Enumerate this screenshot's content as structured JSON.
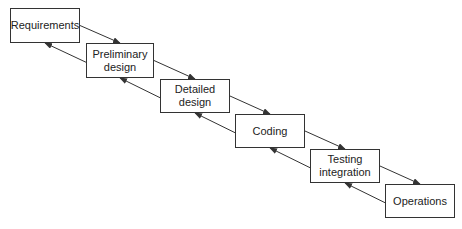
{
  "diagram": {
    "type": "waterfall",
    "stages": [
      {
        "id": "requirements",
        "label": "Requirements",
        "x": 10,
        "y": 8,
        "w": 70,
        "h": 35
      },
      {
        "id": "preliminary-design",
        "label": "Preliminary\ndesign",
        "x": 86,
        "y": 43,
        "w": 68,
        "h": 35
      },
      {
        "id": "detailed-design",
        "label": "Detailed\ndesign",
        "x": 160,
        "y": 79,
        "w": 70,
        "h": 34
      },
      {
        "id": "coding",
        "label": "Coding",
        "x": 235,
        "y": 114,
        "w": 70,
        "h": 34
      },
      {
        "id": "testing-integration",
        "label": "Testing\nintegration",
        "x": 310,
        "y": 149,
        "w": 70,
        "h": 34
      },
      {
        "id": "operations",
        "label": "Operations",
        "x": 385,
        "y": 184,
        "w": 70,
        "h": 34
      }
    ],
    "arrows": [
      {
        "from": "requirements",
        "to": "preliminary-design",
        "direction": "forward"
      },
      {
        "from": "preliminary-design",
        "to": "requirements",
        "direction": "feedback"
      },
      {
        "from": "preliminary-design",
        "to": "detailed-design",
        "direction": "forward"
      },
      {
        "from": "detailed-design",
        "to": "preliminary-design",
        "direction": "feedback"
      },
      {
        "from": "detailed-design",
        "to": "coding",
        "direction": "forward"
      },
      {
        "from": "coding",
        "to": "detailed-design",
        "direction": "feedback"
      },
      {
        "from": "coding",
        "to": "testing-integration",
        "direction": "forward"
      },
      {
        "from": "testing-integration",
        "to": "coding",
        "direction": "feedback"
      },
      {
        "from": "testing-integration",
        "to": "operations",
        "direction": "forward"
      },
      {
        "from": "operations",
        "to": "testing-integration",
        "direction": "feedback"
      }
    ],
    "colors": {
      "line": "#333333",
      "text": "#222222",
      "background": "#ffffff"
    }
  }
}
